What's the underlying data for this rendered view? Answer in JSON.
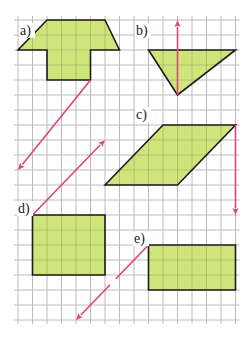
{
  "figure": {
    "colors": {
      "background": "#ffffff",
      "grid": "#b9b2b6",
      "fill": "#cfe57c",
      "outline": "#1c1c1c",
      "vector": "#e0437a"
    },
    "grid": {
      "x0": 18,
      "y0": 20,
      "dx": 14.5,
      "dy": 15,
      "cols": 15,
      "rows": 20
    },
    "figures": [
      {
        "id": "a",
        "label": "a)",
        "label_pos": [
          20,
          35
        ],
        "shape": "T-shape (trapezoid top with square stem)",
        "points": [
          [
            2,
            0
          ],
          [
            6,
            0
          ],
          [
            7,
            2
          ],
          [
            5,
            2
          ],
          [
            5,
            4
          ],
          [
            2,
            4
          ],
          [
            2,
            2
          ],
          [
            0,
            2
          ]
        ],
        "vector": {
          "from": [
            5,
            4
          ],
          "to": [
            0,
            10
          ]
        }
      },
      {
        "id": "b",
        "label": "b)",
        "label_pos": [
          136,
          35
        ],
        "shape": "triangle",
        "points": [
          [
            9,
            2
          ],
          [
            15,
            2
          ],
          [
            11,
            5
          ]
        ],
        "vector": {
          "from": [
            11,
            5
          ],
          "to": [
            11,
            0
          ]
        }
      },
      {
        "id": "c",
        "label": "c)",
        "label_pos": [
          136,
          119
        ],
        "shape": "parallelogram",
        "points": [
          [
            10,
            7
          ],
          [
            15,
            7
          ],
          [
            11,
            11
          ],
          [
            6,
            11
          ]
        ],
        "vector": {
          "from": [
            15,
            7
          ],
          "to": [
            15,
            13
          ]
        }
      },
      {
        "id": "d",
        "label": "d)",
        "label_pos": [
          18,
          213
        ],
        "shape": "rectangle 5x4",
        "points": [
          [
            1,
            13
          ],
          [
            6,
            13
          ],
          [
            6,
            17
          ],
          [
            1,
            17
          ]
        ],
        "vector": {
          "from": [
            1,
            13
          ],
          "to": [
            6,
            8
          ]
        }
      },
      {
        "id": "e",
        "label": "e)",
        "label_pos": [
          134,
          243
        ],
        "shape": "rectangle 6x3",
        "points": [
          [
            9,
            15
          ],
          [
            15,
            15
          ],
          [
            15,
            18
          ],
          [
            9,
            18
          ]
        ],
        "vector": {
          "from": [
            9,
            15
          ],
          "to": [
            4,
            20
          ],
          "gap": [
            0.45,
            0.53
          ]
        }
      }
    ]
  }
}
